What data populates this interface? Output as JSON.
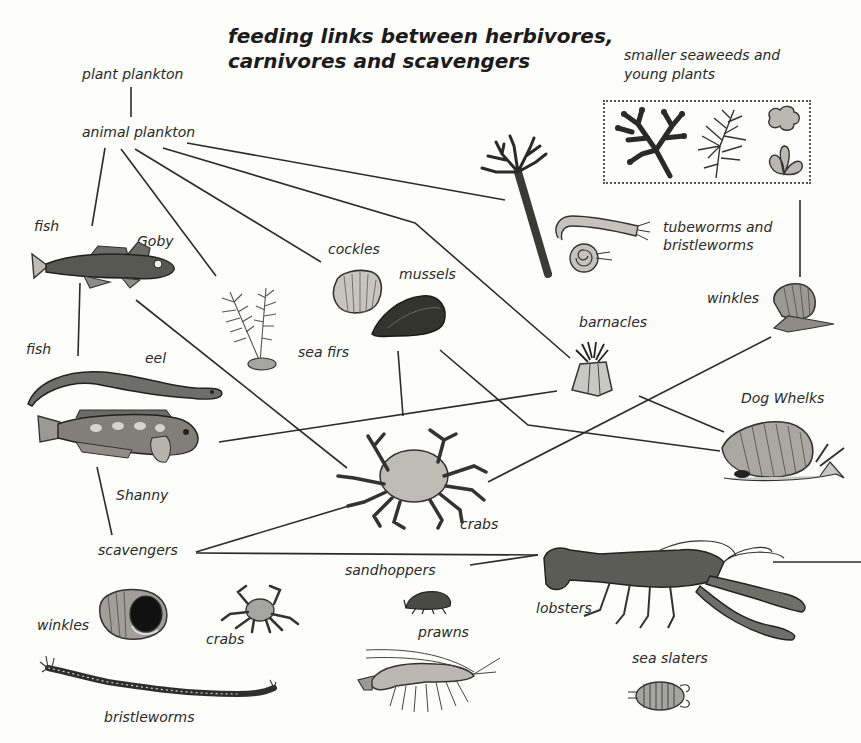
{
  "title": {
    "line1": "feeding links between herbivores,",
    "line2": "carnivores and scavengers"
  },
  "seaweed_group": {
    "label_line1": "smaller seaweeds and",
    "label_line2": "young plants"
  },
  "labels": {
    "plant_plankton": "plant plankton",
    "animal_plankton": "animal plankton",
    "fish_top": "fish",
    "goby": "Goby",
    "cockles": "cockles",
    "mussels": "mussels",
    "sea_firs": "sea firs",
    "tubeworms_line1": "tubeworms and",
    "tubeworms_line2": "bristleworms",
    "winkles_top": "winkles",
    "barnacles": "barnacles",
    "dog_whelks": "Dog Whelks",
    "fish_mid": "fish",
    "eel": "eel",
    "shanny": "Shanny",
    "crabs_mid": "crabs",
    "scavengers": "scavengers",
    "sandhoppers": "sandhoppers",
    "lobsters": "lobsters",
    "winkles_bottom": "winkles",
    "crabs_bottom": "crabs",
    "prawns": "prawns",
    "sea_slaters": "sea slaters",
    "bristleworms": "bristleworms"
  },
  "organisms": [
    "goby",
    "eel",
    "shanny",
    "sea firs",
    "cockles",
    "mussels",
    "tubeworm colony",
    "tubeworm",
    "spiral tubeworm",
    "winkle",
    "barnacle",
    "dog whelk",
    "crab",
    "lobster",
    "winkle shell",
    "small crab",
    "sandhopper",
    "prawn",
    "sea slater",
    "bristleworm",
    "branched seaweed",
    "feathery seaweed",
    "sea lettuce",
    "leafy seaweed"
  ],
  "links": [
    {
      "from": "plant plankton",
      "to": "animal plankton"
    },
    {
      "from": "animal plankton",
      "to": "fish"
    },
    {
      "from": "animal plankton",
      "to": "sea firs"
    },
    {
      "from": "animal plankton",
      "to": "cockles"
    },
    {
      "from": "animal plankton",
      "to": "barnacles"
    },
    {
      "from": "animal plankton",
      "to": "tubeworms and bristleworms"
    },
    {
      "from": "fish",
      "to": "fish (eel/Shanny)"
    },
    {
      "from": "Goby",
      "to": "crabs"
    },
    {
      "from": "mussels",
      "to": "crabs"
    },
    {
      "from": "barnacles",
      "to": "Shanny"
    },
    {
      "from": "mussels",
      "to": "Dog Whelks"
    },
    {
      "from": "barnacles",
      "to": "Dog Whelks"
    },
    {
      "from": "smaller seaweeds and young plants",
      "to": "winkles"
    },
    {
      "from": "winkles",
      "to": "crabs"
    },
    {
      "from": "Shanny",
      "to": "scavengers"
    },
    {
      "from": "scavengers",
      "to": "crabs"
    },
    {
      "from": "scavengers",
      "to": "lobsters"
    },
    {
      "from": "sandhoppers",
      "to": "lobsters"
    }
  ],
  "colors": {
    "ink": "#222222",
    "line": "#2b2b2b",
    "shade_light": "#c9c9c3",
    "shade_mid": "#8d8d86",
    "shade_dark": "#3a3a36",
    "paper": "#fdfdfb"
  }
}
